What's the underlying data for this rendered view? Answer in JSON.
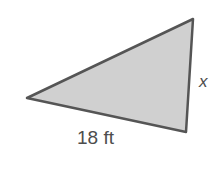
{
  "figure": {
    "shape": "triangle",
    "vertices": [
      [
        27,
        98
      ],
      [
        193,
        19
      ],
      [
        186,
        132
      ]
    ],
    "fill_color": "#d0d0d0",
    "stroke_color": "#555555",
    "labels": {
      "side_right": "x",
      "side_bottom": "18 ft"
    }
  }
}
